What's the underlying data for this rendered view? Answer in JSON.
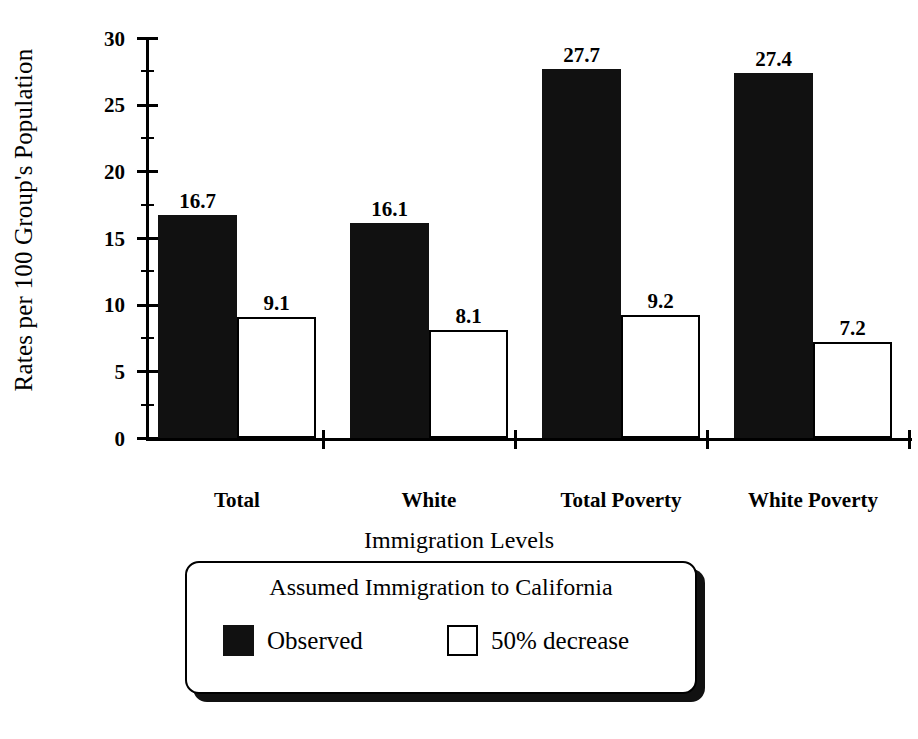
{
  "chart_data": {
    "type": "bar",
    "title": "",
    "xlabel": "",
    "ylabel": "Rates per 100 Group's Population",
    "ylim": [
      0,
      30
    ],
    "yticks": [
      0,
      5,
      10,
      15,
      20,
      25,
      30
    ],
    "ytick_labels": [
      "0",
      "5",
      "10",
      "15",
      "20",
      "25",
      "30"
    ],
    "grid": false,
    "legend_position": "below",
    "categories": [
      "Total",
      "White",
      "Total Poverty",
      "White Poverty"
    ],
    "series": [
      {
        "name": "Observed",
        "color": "#111111",
        "style": "filled",
        "values": [
          16.7,
          16.1,
          27.7,
          27.4
        ],
        "value_labels": [
          "16.7",
          "16.1",
          "27.7",
          "27.4"
        ]
      },
      {
        "name": "50% decrease",
        "color": "#ffffff",
        "style": "hollow",
        "values": [
          9.1,
          8.1,
          9.2,
          7.2
        ],
        "value_labels": [
          "9.1",
          "8.1",
          "9.2",
          "7.2"
        ]
      }
    ]
  },
  "axes": {
    "y_title": "Rates per 100 Group's Population",
    "ticks": [
      {
        "label": "30",
        "value": 30
      },
      {
        "label": "25",
        "value": 25
      },
      {
        "label": "20",
        "value": 20
      },
      {
        "label": "15",
        "value": 15
      },
      {
        "label": "10",
        "value": 10
      },
      {
        "label": "5",
        "value": 5
      },
      {
        "label": "0",
        "value": 0
      }
    ]
  },
  "categories": [
    {
      "label": "Total"
    },
    {
      "label": "White"
    },
    {
      "label": "Total Poverty"
    },
    {
      "label": "White Poverty"
    }
  ],
  "bars": [
    {
      "group": "Total",
      "series": "Observed",
      "value_label": "16.7"
    },
    {
      "group": "Total",
      "series": "50% decrease",
      "value_label": "9.1"
    },
    {
      "group": "White",
      "series": "Observed",
      "value_label": "16.1"
    },
    {
      "group": "White",
      "series": "50% decrease",
      "value_label": "8.1"
    },
    {
      "group": "Total Poverty",
      "series": "Observed",
      "value_label": "27.7"
    },
    {
      "group": "Total Poverty",
      "series": "50% decrease",
      "value_label": "9.2"
    },
    {
      "group": "White Poverty",
      "series": "Observed",
      "value_label": "27.4"
    },
    {
      "group": "White Poverty",
      "series": "50% decrease",
      "value_label": "7.2"
    }
  ],
  "legend": {
    "title": "Immigration Levels",
    "subtitle": "Assumed Immigration to California",
    "entries": [
      {
        "label": "Observed",
        "swatch": "filled-square-icon"
      },
      {
        "label": "50% decrease",
        "swatch": "hollow-square-icon"
      }
    ]
  },
  "colors": {
    "observed": "#111111",
    "decrease": "#ffffff",
    "outline": "#000000",
    "background": "#ffffff"
  }
}
